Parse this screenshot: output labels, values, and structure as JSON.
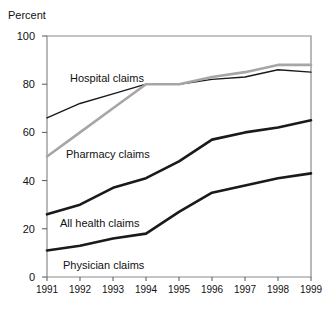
{
  "chart_data": {
    "type": "line",
    "title": "",
    "xlabel": "",
    "ylabel": "Percent",
    "ylim": [
      0,
      100
    ],
    "yticks": [
      0,
      20,
      40,
      60,
      80,
      100
    ],
    "grid": false,
    "legend_position": "inline-annotations",
    "categories": [
      "1991",
      "1992",
      "1993",
      "1994",
      "1995",
      "1996",
      "1997",
      "1998",
      "1999"
    ],
    "x": [
      1991,
      1992,
      1993,
      1994,
      1995,
      1996,
      1997,
      1998,
      1999
    ],
    "series": [
      {
        "name": "Hospital claims",
        "color": "#1a1a1a",
        "width": 1.4,
        "values": [
          66,
          72,
          76,
          80,
          80,
          82,
          83,
          86,
          85
        ]
      },
      {
        "name": "Pharmacy claims",
        "color": "#a6a6a6",
        "width": 2.6,
        "values": [
          50,
          60,
          70,
          80,
          80,
          83,
          85,
          88,
          88
        ]
      },
      {
        "name": "All health claims",
        "color": "#1a1a1a",
        "width": 2.6,
        "values": [
          26,
          30,
          37,
          41,
          48,
          57,
          60,
          62,
          65
        ]
      },
      {
        "name": "Physician claims",
        "color": "#1a1a1a",
        "width": 2.6,
        "values": [
          11,
          13,
          16,
          18,
          27,
          35,
          38,
          41,
          43
        ]
      }
    ],
    "annotations": [
      {
        "text": "Hospital claims",
        "x": 70,
        "y": 72
      },
      {
        "text": "Pharmacy claims",
        "x": 66,
        "y": 148
      },
      {
        "text": "All health claims",
        "x": 60,
        "y": 217
      },
      {
        "text": "Physician claims",
        "x": 63,
        "y": 259
      }
    ]
  },
  "plot": {
    "left": 47,
    "right": 311,
    "top": 36,
    "bottom": 277,
    "frame_color": "#8a8a8a",
    "tick_color": "#555555"
  }
}
